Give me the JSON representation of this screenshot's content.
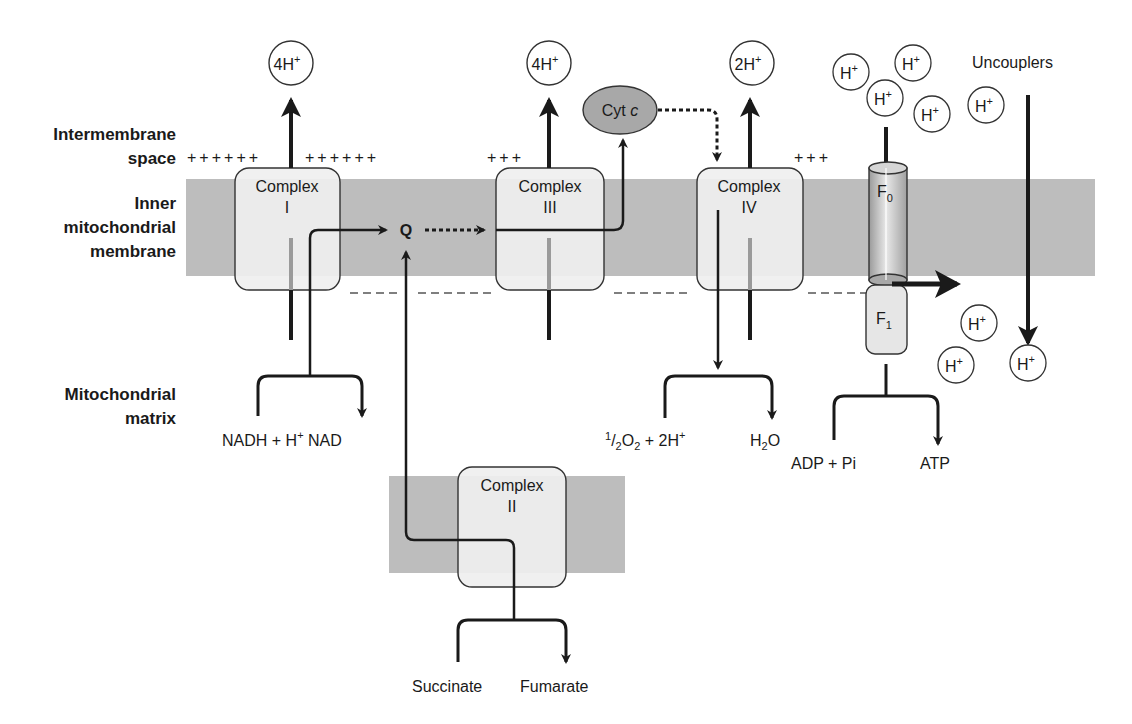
{
  "regions": {
    "intermembrane_line1": "Intermembrane",
    "intermembrane_line2": "space",
    "inner_line1": "Inner",
    "inner_line2": "mitochondrial",
    "inner_line3": "membrane",
    "matrix_line1": "Mitochondrial",
    "matrix_line2": "matrix"
  },
  "charges": {
    "left_a": "++++++",
    "left_b": "++++++",
    "mid": "+++",
    "right": "+++"
  },
  "complexes": [
    {
      "name": "Complex",
      "numeral": "I"
    },
    {
      "name": "Complex",
      "numeral": "II"
    },
    {
      "name": "Complex",
      "numeral": "III"
    },
    {
      "name": "Complex",
      "numeral": "IV"
    }
  ],
  "atp_synthase": {
    "f0_base": "F",
    "f0_sub": "0",
    "f1_base": "F",
    "f1_sub": "1"
  },
  "carriers": {
    "ubiquinone": "Q",
    "cytochrome_c_base": "Cyt ",
    "cytochrome_c_italic": "c"
  },
  "proton_pumps": [
    {
      "coef": "4H",
      "charge": "+"
    },
    {
      "coef": "4H",
      "charge": "+"
    },
    {
      "coef": "2H",
      "charge": "+"
    }
  ],
  "protons": {
    "base": "H",
    "charge": "+"
  },
  "uncouplers_label": "Uncouplers",
  "reactions": {
    "complex1": {
      "substrate_a": "NADH + H",
      "substrate_sup": "+",
      "product": "NAD"
    },
    "complex2": {
      "substrate": "Succinate",
      "product": "Fumarate"
    },
    "complex4": {
      "half_sup": "1",
      "half_sub": "2",
      "o": "O",
      "o_sub": "2",
      "rest": " + 2H",
      "rest_sup": "+",
      "product_h": "H",
      "product_sub": "2",
      "product_o": "O"
    },
    "atp": {
      "substrate": "ADP + Pi",
      "product": "ATP"
    }
  },
  "colors": {
    "membrane": "#bdbdbd",
    "complex_fill": "#efefef",
    "cytc_fill": "#a8a8a8",
    "ink": "#1a1a1a",
    "dashed": "#555555"
  }
}
